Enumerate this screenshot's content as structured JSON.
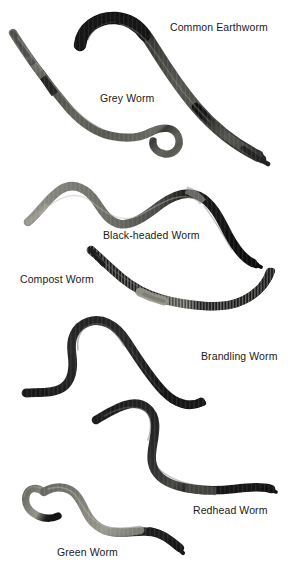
{
  "figure": {
    "kind": "annotated-photo-plate",
    "background_color": "#ffffff",
    "label_color": "#1a1a1a",
    "width": 297,
    "height": 574
  },
  "labels": [
    {
      "id": "common-earthworm",
      "text": "Common Earthworm"
    },
    {
      "id": "grey-worm",
      "text": "Grey Worm"
    },
    {
      "id": "black-headed",
      "text": "Black-headed Worm"
    },
    {
      "id": "compost-worm",
      "text": "Compost Worm"
    },
    {
      "id": "brandling-worm",
      "text": "Brandling Worm"
    },
    {
      "id": "redhead-worm",
      "text": "Redhead Worm"
    },
    {
      "id": "green-worm",
      "text": "Green Worm"
    }
  ],
  "specimens": [
    {
      "id": "common-earthworm",
      "name": "Common Earthworm",
      "head_color": "#171717",
      "body_color": "#4a4a46",
      "tail_color": "#2e2e2c",
      "banded": false
    },
    {
      "id": "grey-worm",
      "name": "Grey Worm",
      "head_color": "#5c5c58",
      "body_color": "#6d6d68",
      "tail_color": "#3c3c3a",
      "banded": false
    },
    {
      "id": "black-headed",
      "name": "Black-headed Worm",
      "head_color": "#8a8a85",
      "body_color": "#6a6a65",
      "tail_color": "#121212",
      "banded": false
    },
    {
      "id": "compost-worm",
      "name": "Compost Worm",
      "head_color": "#1b1b1b",
      "body_color": "#232323",
      "tail_color": "#1b1b1b",
      "banded": true
    },
    {
      "id": "brandling-worm",
      "name": "Brandling Worm",
      "head_color": "#1e1e1e",
      "body_color": "#262626",
      "tail_color": "#1a1a1a",
      "banded": false
    },
    {
      "id": "redhead-worm",
      "name": "Redhead Worm",
      "head_color": "#1c1c1c",
      "body_color": "#242424",
      "tail_color": "#161616",
      "banded": false
    },
    {
      "id": "green-worm",
      "name": "Green Worm",
      "head_color": "#6f6f68",
      "body_color": "#8c8c84",
      "tail_color": "#1d1d1d",
      "banded": false
    }
  ]
}
